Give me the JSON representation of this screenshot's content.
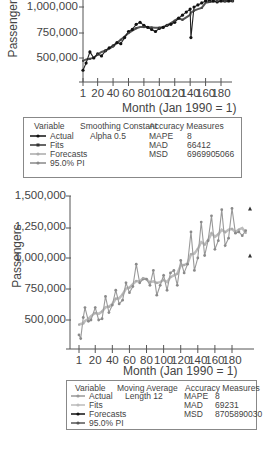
{
  "chart_data": [
    {
      "type": "line",
      "title": "",
      "xlabel": "Month (Jan 1990 = 1)",
      "ylabel": "Passengers",
      "x_ticks": [
        "1",
        "20",
        "40",
        "60",
        "80",
        "100",
        "120",
        "140",
        "160",
        "180"
      ],
      "y_ticks": [
        "500,000",
        "750,000",
        "1,000,000"
      ],
      "ylim": [
        350000,
        1080000
      ],
      "xlim": [
        1,
        200
      ],
      "grid": false,
      "legend_position": "below",
      "method": "Single Exponential Smoothing",
      "smoothing_constant": "Alpha 0.5",
      "series": [
        {
          "name": "Actual",
          "color": "#111111"
        },
        {
          "name": "Fits",
          "color": "#333333"
        },
        {
          "name": "Forecasts",
          "color": "#aaaaaa"
        },
        {
          "name": "95.0% PI",
          "color": "#888888"
        }
      ],
      "accuracy": {
        "MAPE": "8",
        "MAD": "66412",
        "MSD": "6969905066"
      },
      "approx_points": {
        "x": [
          1,
          5,
          10,
          15,
          20,
          25,
          30,
          35,
          40,
          45,
          50,
          55,
          60,
          65,
          70,
          75,
          80,
          85,
          90,
          95,
          100,
          105,
          110,
          115,
          120,
          125,
          130,
          135,
          140,
          141,
          145,
          150,
          155,
          160,
          165,
          170,
          175,
          180,
          185,
          190,
          195
        ],
        "y": [
          380000,
          450000,
          560000,
          500000,
          540000,
          520000,
          570000,
          600000,
          620000,
          650000,
          640000,
          700000,
          760000,
          780000,
          830000,
          850000,
          820000,
          800000,
          780000,
          760000,
          790000,
          800000,
          820000,
          830000,
          850000,
          890000,
          920000,
          950000,
          980000,
          700000,
          1000000,
          1020000,
          1040000,
          1060000,
          1070000,
          1060000,
          1050000,
          1060000,
          1070000,
          1060000,
          1070000
        ]
      }
    },
    {
      "type": "line",
      "title": "",
      "xlabel": "Month (Jan 1990 = 1)",
      "ylabel": "Passengers",
      "x_ticks": [
        "1",
        "20",
        "40",
        "60",
        "80",
        "100",
        "120",
        "140",
        "160",
        "180"
      ],
      "y_ticks": [
        "500,000",
        "750,000",
        "1,000,000",
        "1,250,000",
        "1,500,000"
      ],
      "ylim": [
        300000,
        1500000
      ],
      "xlim": [
        1,
        200
      ],
      "grid": false,
      "legend_position": "below",
      "method": "Moving Average",
      "moving_average": "Length 12",
      "series": [
        {
          "name": "Actual",
          "color": "#999999"
        },
        {
          "name": "Fits",
          "color": "#bbbbbb"
        },
        {
          "name": "Forecasts",
          "color": "#111111"
        },
        {
          "name": "95.0% PI",
          "color": "#555555"
        }
      ],
      "accuracy": {
        "MAPE": "8",
        "MAD": "69231",
        "MSD": "8705890030"
      },
      "forecast_end": {
        "upper": 1400000,
        "point": 1210000,
        "lower": 1020000
      },
      "approx_points": {
        "x": [
          1,
          3,
          6,
          8,
          12,
          15,
          20,
          24,
          28,
          32,
          36,
          40,
          44,
          48,
          52,
          56,
          60,
          64,
          68,
          72,
          76,
          80,
          84,
          88,
          92,
          96,
          100,
          104,
          108,
          112,
          116,
          120,
          124,
          128,
          132,
          136,
          140,
          144,
          148,
          152,
          156,
          160,
          164,
          168,
          172,
          176,
          180,
          184,
          188,
          192,
          196
        ],
        "y": [
          380000,
          350000,
          520000,
          600000,
          490000,
          500000,
          600000,
          500000,
          510000,
          690000,
          560000,
          620000,
          740000,
          630000,
          660000,
          800000,
          720000,
          770000,
          950000,
          800000,
          830000,
          830000,
          780000,
          900000,
          700000,
          780000,
          860000,
          740000,
          880000,
          900000,
          780000,
          980000,
          880000,
          950000,
          1210000,
          900000,
          1000000,
          1290000,
          1020000,
          1140000,
          1340000,
          1070000,
          1140000,
          1390000,
          1100000,
          1160000,
          1400000,
          1200000,
          1210000,
          1180000,
          1220000
        ]
      }
    }
  ],
  "top_chart": {
    "y_labels": [
      "1,000,000",
      "750,000",
      "500,000"
    ],
    "y_axis_title": "Passengers",
    "x_labels": [
      "1",
      "20",
      "40",
      "60",
      "80",
      "100",
      "120",
      "140",
      "160",
      "180"
    ],
    "x_axis_title": "Month (Jan 1990 = 1)",
    "legend": {
      "col1_header": "Variable",
      "col2_header": "Smoothing Constant",
      "col3_header": "Accuracy Measures",
      "items": [
        "Actual",
        "Fits",
        "Forecasts",
        "95.0% PI"
      ],
      "param_value": "Alpha 0.5",
      "measures": [
        {
          "name": "MAPE",
          "value": "8"
        },
        {
          "name": "MAD",
          "value": "66412"
        },
        {
          "name": "MSD",
          "value": "6969905066"
        }
      ]
    }
  },
  "bottom_chart": {
    "y_labels": [
      "1,500,000",
      "1,250,000",
      "1,000,000",
      "750,000",
      "500,000"
    ],
    "y_axis_title": "Passengers",
    "x_labels": [
      "1",
      "20",
      "40",
      "60",
      "80",
      "100",
      "120",
      "140",
      "160",
      "180"
    ],
    "x_axis_title": "Month (Jan 1990 = 1)",
    "legend": {
      "col1_header": "Variable",
      "col2_header": "Moving Average",
      "col3_header": "Accuracy Measures",
      "items": [
        "Actual",
        "Fits",
        "Forecasts",
        "95.0% PI"
      ],
      "param_value": "Length 12",
      "measures": [
        {
          "name": "MAPE",
          "value": "8"
        },
        {
          "name": "MAD",
          "value": "69231"
        },
        {
          "name": "MSD",
          "value": "8705890030"
        }
      ]
    }
  }
}
